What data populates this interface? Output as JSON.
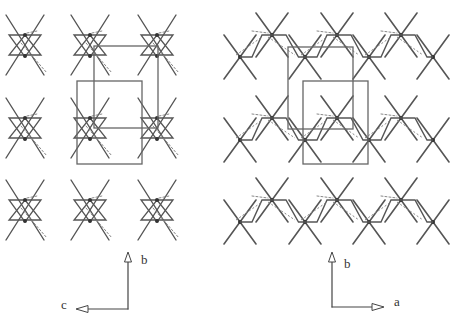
{
  "figure": {
    "left_panel": {
      "view": "projection along a",
      "axes": {
        "vertical": "b",
        "horizontal": "c"
      },
      "motif_centers": [
        [
          25,
          45
        ],
        [
          90,
          45
        ],
        [
          157,
          45
        ],
        [
          25,
          128
        ],
        [
          90,
          128
        ],
        [
          157,
          128
        ],
        [
          25,
          210
        ],
        [
          90,
          210
        ],
        [
          157,
          210
        ]
      ],
      "unit_cells": [
        {
          "x": 94,
          "y": 46,
          "w": 64,
          "h": 82
        },
        {
          "x": 77,
          "y": 81,
          "w": 65,
          "h": 83
        }
      ]
    },
    "right_panel": {
      "view": "projection along c",
      "axes": {
        "vertical": "b",
        "horizontal": "a"
      },
      "chains_y": [
        [
          35,
          57
        ],
        [
          118,
          140
        ],
        [
          200,
          222
        ]
      ],
      "upper_atoms_x": [
        272,
        337,
        401
      ],
      "lower_atoms_x": [
        240,
        305,
        369,
        433
      ],
      "unit_cells": [
        {
          "x": 288,
          "y": 47,
          "w": 65,
          "h": 82
        },
        {
          "x": 303,
          "y": 81,
          "w": 65,
          "h": 83
        }
      ]
    }
  },
  "labels": {
    "left_b": "b",
    "left_c": "c",
    "right_b": "b",
    "right_a": "a"
  },
  "colors": {
    "line": "#555555",
    "dash": "#888888",
    "box": "#666666"
  }
}
